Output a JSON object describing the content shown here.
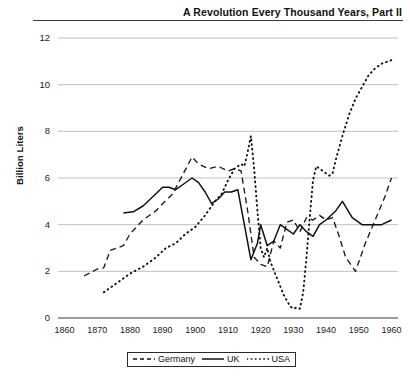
{
  "title": "A Revolution Every Thousand Years, Part II",
  "axis": {
    "ylabel": "Billion Liters",
    "yticks": [
      "0",
      "2",
      "4",
      "6",
      "8",
      "10",
      "12"
    ],
    "xticks": [
      "1860",
      "1870",
      "1880",
      "1890",
      "1900",
      "1910",
      "1920",
      "1930",
      "1940",
      "1950",
      "1960"
    ]
  },
  "legend": {
    "items": [
      {
        "label": "Germany",
        "style": "dashed"
      },
      {
        "label": "UK",
        "style": "solid"
      },
      {
        "label": "USA",
        "style": "dotted"
      }
    ]
  },
  "chart_data": {
    "type": "line",
    "title": "A Revolution Every Thousand Years, Part II",
    "xlabel": "",
    "ylabel": "Billion Liters",
    "xlim": [
      1858,
      1962
    ],
    "ylim": [
      0,
      12
    ],
    "grid": true,
    "legend_position": "bottom-center",
    "series": [
      {
        "name": "Germany",
        "style": "dashed",
        "color": "#1a1a1a",
        "points": [
          [
            1866,
            1.8
          ],
          [
            1870,
            2.1
          ],
          [
            1872,
            2.15
          ],
          [
            1874,
            2.9
          ],
          [
            1876,
            3.0
          ],
          [
            1878,
            3.1
          ],
          [
            1880,
            3.6
          ],
          [
            1884,
            4.2
          ],
          [
            1888,
            4.6
          ],
          [
            1890,
            4.9
          ],
          [
            1893,
            5.3
          ],
          [
            1896,
            6.1
          ],
          [
            1899,
            6.9
          ],
          [
            1901,
            6.6
          ],
          [
            1904,
            6.4
          ],
          [
            1907,
            6.5
          ],
          [
            1910,
            6.3
          ],
          [
            1912,
            6.4
          ],
          [
            1914,
            6.3
          ],
          [
            1916,
            4.6
          ],
          [
            1918,
            2.6
          ],
          [
            1920,
            2.3
          ],
          [
            1922,
            2.2
          ],
          [
            1924,
            3.3
          ],
          [
            1926,
            3.0
          ],
          [
            1928,
            4.1
          ],
          [
            1930,
            4.2
          ],
          [
            1932,
            3.7
          ],
          [
            1934,
            4.3
          ],
          [
            1936,
            4.2
          ],
          [
            1938,
            4.4
          ],
          [
            1940,
            4.2
          ],
          [
            1942,
            4.3
          ],
          [
            1944,
            3.5
          ],
          [
            1946,
            2.6
          ],
          [
            1949,
            2.0
          ],
          [
            1952,
            3.2
          ],
          [
            1955,
            4.2
          ],
          [
            1958,
            5.2
          ],
          [
            1960,
            6.0
          ]
        ]
      },
      {
        "name": "UK",
        "style": "solid",
        "color": "#111111",
        "points": [
          [
            1878,
            4.5
          ],
          [
            1881,
            4.55
          ],
          [
            1884,
            4.8
          ],
          [
            1887,
            5.2
          ],
          [
            1890,
            5.6
          ],
          [
            1892,
            5.6
          ],
          [
            1894,
            5.5
          ],
          [
            1896,
            5.7
          ],
          [
            1899,
            6.0
          ],
          [
            1901,
            5.8
          ],
          [
            1903,
            5.4
          ],
          [
            1905,
            4.9
          ],
          [
            1907,
            5.1
          ],
          [
            1909,
            5.4
          ],
          [
            1911,
            5.4
          ],
          [
            1913,
            5.5
          ],
          [
            1915,
            4.0
          ],
          [
            1917,
            2.5
          ],
          [
            1919,
            3.2
          ],
          [
            1920,
            4.0
          ],
          [
            1922,
            3.1
          ],
          [
            1924,
            3.3
          ],
          [
            1926,
            4.0
          ],
          [
            1928,
            3.8
          ],
          [
            1930,
            3.6
          ],
          [
            1932,
            4.0
          ],
          [
            1934,
            3.7
          ],
          [
            1936,
            3.5
          ],
          [
            1938,
            4.0
          ],
          [
            1940,
            4.2
          ],
          [
            1943,
            4.6
          ],
          [
            1945,
            5.0
          ],
          [
            1948,
            4.3
          ],
          [
            1951,
            4.0
          ],
          [
            1955,
            4.0
          ],
          [
            1957,
            4.0
          ],
          [
            1960,
            4.2
          ]
        ]
      },
      {
        "name": "USA",
        "style": "dotted",
        "color": "#111111",
        "points": [
          [
            1872,
            1.1
          ],
          [
            1876,
            1.5
          ],
          [
            1880,
            1.9
          ],
          [
            1884,
            2.2
          ],
          [
            1888,
            2.6
          ],
          [
            1891,
            3.0
          ],
          [
            1894,
            3.2
          ],
          [
            1897,
            3.6
          ],
          [
            1900,
            3.9
          ],
          [
            1903,
            4.4
          ],
          [
            1906,
            5.0
          ],
          [
            1908,
            5.3
          ],
          [
            1910,
            5.9
          ],
          [
            1912,
            6.4
          ],
          [
            1914,
            6.6
          ],
          [
            1915,
            6.5
          ],
          [
            1916,
            7.1
          ],
          [
            1917,
            7.8
          ],
          [
            1918,
            6.4
          ],
          [
            1919,
            4.6
          ],
          [
            1920,
            3.0
          ],
          [
            1921,
            2.6
          ],
          [
            1922,
            3.0
          ],
          [
            1923,
            2.4
          ],
          [
            1925,
            1.7
          ],
          [
            1927,
            1.0
          ],
          [
            1929,
            0.5
          ],
          [
            1930,
            0.4
          ],
          [
            1931,
            0.45
          ],
          [
            1932,
            0.4
          ],
          [
            1933,
            1.1
          ],
          [
            1934,
            2.6
          ],
          [
            1935,
            4.3
          ],
          [
            1936,
            5.9
          ],
          [
            1937,
            6.5
          ],
          [
            1939,
            6.3
          ],
          [
            1941,
            6.1
          ],
          [
            1942,
            6.2
          ],
          [
            1943,
            6.8
          ],
          [
            1945,
            7.8
          ],
          [
            1947,
            8.7
          ],
          [
            1949,
            9.4
          ],
          [
            1951,
            9.9
          ],
          [
            1953,
            10.4
          ],
          [
            1955,
            10.7
          ],
          [
            1957,
            10.9
          ],
          [
            1959,
            11.0
          ],
          [
            1960,
            11.05
          ]
        ]
      }
    ]
  }
}
